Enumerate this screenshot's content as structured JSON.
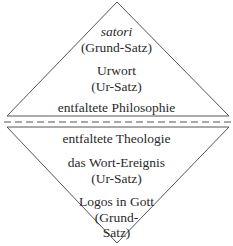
{
  "upper_triangle": {
    "lines": [
      {
        "text": "satori",
        "italic": true
      },
      {
        "text": "(Grund-Satz)"
      },
      {
        "text": "Urwort"
      },
      {
        "text": "(Ur-Satz)"
      },
      {
        "text": "entfaltete Philosophie"
      }
    ]
  },
  "divider": {
    "style": "dashed"
  },
  "lower_triangle": {
    "lines": [
      {
        "text": "entfaltete Theologie"
      },
      {
        "text": "das Wort-Ereignis"
      },
      {
        "text": "(Ur-Satz)"
      },
      {
        "text": "Logos in Gott"
      },
      {
        "text": "(Grund-"
      },
      {
        "text": "Satz)"
      }
    ]
  },
  "colors": {
    "line": "#555555",
    "text": "#2a2a2a",
    "background": "#ffffff"
  }
}
